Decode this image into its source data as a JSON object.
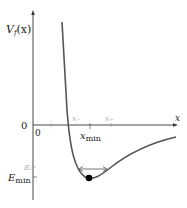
{
  "diagram": {
    "type": "potential-energy-well",
    "y_axis_label": "V_f(x)",
    "y_axis_label_main": "V",
    "y_axis_label_sub": "f",
    "y_axis_label_arg": "(x)",
    "x_axis_label": "x",
    "origin_y_label": "0",
    "origin_x_label": "0",
    "xmin_label_main": "x",
    "xmin_label_sub": "min",
    "x_minus_label": "x₋",
    "x_plus_label": "x₊",
    "Emin_label_main": "E",
    "Emin_label_sub": "min",
    "E0_label": "E₀",
    "colors": {
      "axis": "#333333",
      "curve": "#555555",
      "faint_labels": "#b5b5b5",
      "dot": "#000000",
      "arrow": "#666666"
    }
  }
}
